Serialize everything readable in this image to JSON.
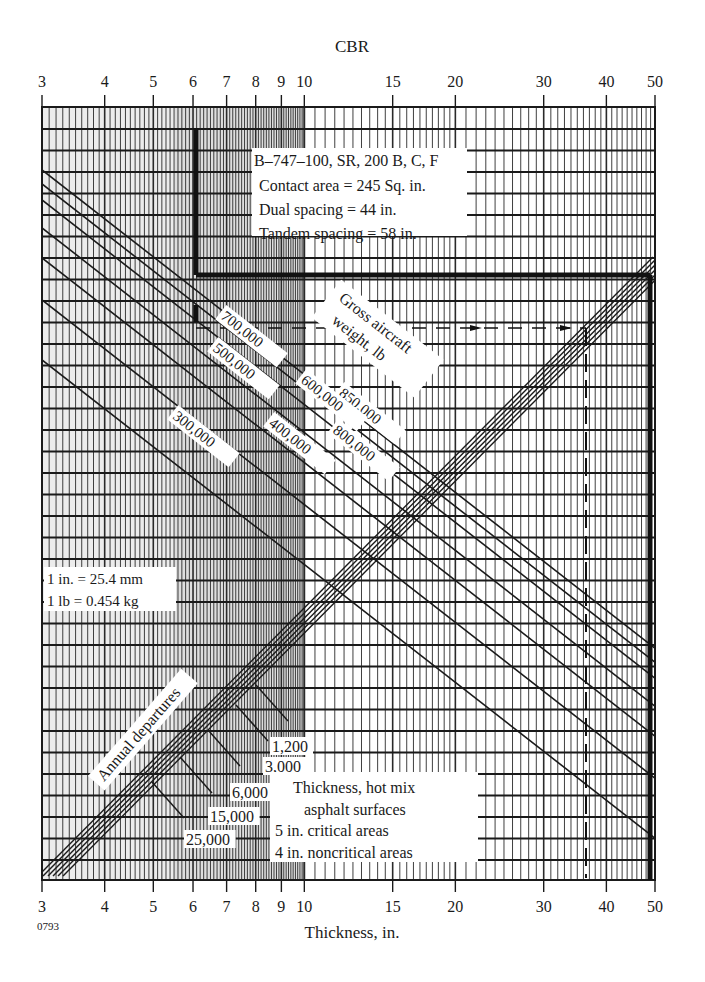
{
  "chart_data": {
    "type": "line",
    "title": "CBR",
    "top_axis_label": "CBR",
    "xlabel": "Thickness, in.",
    "figure_code": "0793",
    "x_scale": "log",
    "xlim": [
      3,
      50
    ],
    "top_ticks": [
      3,
      4,
      5,
      6,
      7,
      8,
      9,
      10,
      15,
      20,
      30,
      40,
      50
    ],
    "bottom_ticks": [
      3,
      4,
      5,
      6,
      7,
      8,
      9,
      10,
      15,
      20,
      30,
      40,
      50
    ],
    "aircraft_info": {
      "line1": "B–747–100, SR, 200 B, C, F",
      "line2": "Contact area = 245 Sq. in.",
      "line3": "Dual spacing = 44 in.",
      "line4": "Tandem spacing = 58 in."
    },
    "gross_weight_label_1": "Gross aircraft",
    "gross_weight_label_2": "weight, lb",
    "gross_weight_series": [
      {
        "name": "850,000",
        "label": "850,000"
      },
      {
        "name": "800,000",
        "label": "800,000"
      },
      {
        "name": "700,000",
        "label": "700,000"
      },
      {
        "name": "600,000",
        "label": "600,000"
      },
      {
        "name": "500,000",
        "label": "500,000"
      },
      {
        "name": "400,000",
        "label": "400,000"
      },
      {
        "name": "300,000",
        "label": "300,000"
      }
    ],
    "annual_departures_label": "Annual departures",
    "annual_departures_series": [
      {
        "name": "1,200",
        "label": "1,200"
      },
      {
        "name": "3,000",
        "label": "3,000"
      },
      {
        "name": "6,000",
        "label": "6,000"
      },
      {
        "name": "15,000",
        "label": "15,000"
      },
      {
        "name": "25,000",
        "label": "25,000"
      }
    ],
    "conversions": {
      "line1": "1 in. = 25.4 mm",
      "line2": "1 lb = 0.454 kg"
    },
    "surface_note": {
      "line1": "Thickness, hot mix",
      "line2": "asphalt surfaces",
      "line3": "5 in. critical areas",
      "line4": "4 in. noncritical areas"
    },
    "example_path": {
      "cbr_start": 6,
      "thickness_result": 48,
      "dashed_result": 35
    },
    "grid": true
  }
}
